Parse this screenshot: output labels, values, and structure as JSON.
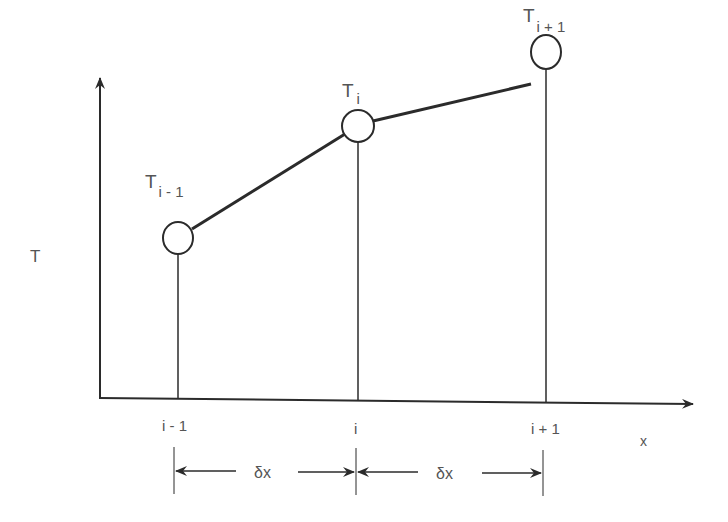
{
  "diagram": {
    "y_axis_label": "T",
    "x_axis_label": "x",
    "nodes": [
      {
        "label_main": "T",
        "label_sub": "i - 1",
        "x_label": "i - 1"
      },
      {
        "label_main": "T",
        "label_sub": "i",
        "x_label": "i"
      },
      {
        "label_main": "T",
        "label_sub": "i + 1",
        "x_label": "i + 1"
      }
    ],
    "spacing_labels": [
      "δx",
      "δx"
    ],
    "colors": {
      "line": "#2b2b2b",
      "text": "#555555",
      "background": "#ffffff"
    }
  }
}
